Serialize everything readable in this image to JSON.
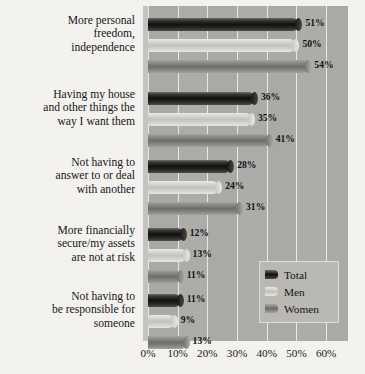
{
  "chart_data": {
    "type": "bar",
    "orientation": "horizontal",
    "title": "",
    "xlabel": "",
    "ylabel": "",
    "xlim": [
      0,
      65
    ],
    "grid": true,
    "legend_position": "bottom-right-inside",
    "tick_labels": [
      "0%",
      "10%",
      "20%",
      "30%",
      "40%",
      "50%",
      "60%"
    ],
    "tick_values": [
      0,
      10,
      20,
      30,
      40,
      50,
      60
    ],
    "categories": [
      "More personal freedom, independence",
      "Having my house and other things the way I want them",
      "Not having to answer to or deal with another",
      "More financially secure/my assets are not at risk",
      "Not having to be responsible for someone"
    ],
    "category_lines": [
      [
        "More personal",
        "freedom,",
        "independence"
      ],
      [
        "Having my house",
        "and other things the",
        "way I want them"
      ],
      [
        "Not having to",
        "answer to or deal",
        "with another"
      ],
      [
        "More financially",
        "secure/my assets",
        "are not at risk"
      ],
      [
        "Not having to",
        "be responsible for",
        "someone"
      ]
    ],
    "series": [
      {
        "name": "Total",
        "color": "#121110",
        "values": [
          51,
          36,
          28,
          12,
          11
        ],
        "labels": [
          "51%",
          "36%",
          "28%",
          "12%",
          "11%"
        ]
      },
      {
        "name": "Men",
        "color": "#c3c2bb",
        "values": [
          50,
          35,
          24,
          13,
          9
        ],
        "labels": [
          "50%",
          "35%",
          "24%",
          "13%",
          "9%"
        ]
      },
      {
        "name": "Women",
        "color": "#6f6d68",
        "values": [
          54,
          41,
          31,
          11,
          13
        ],
        "labels": [
          "54%",
          "41%",
          "31%",
          "11%",
          "13%"
        ]
      }
    ]
  },
  "legend": {
    "items": [
      {
        "label": "Total",
        "swatch": "legend-swatch-total"
      },
      {
        "label": "Men",
        "swatch": "legend-swatch-men"
      },
      {
        "label": "Women",
        "swatch": "legend-swatch-women"
      }
    ]
  },
  "colors": {
    "plot_background": "#a9a9a5",
    "page_background": "#f3f2ef",
    "gridline": "#e8e7e3",
    "text": "#161616"
  }
}
